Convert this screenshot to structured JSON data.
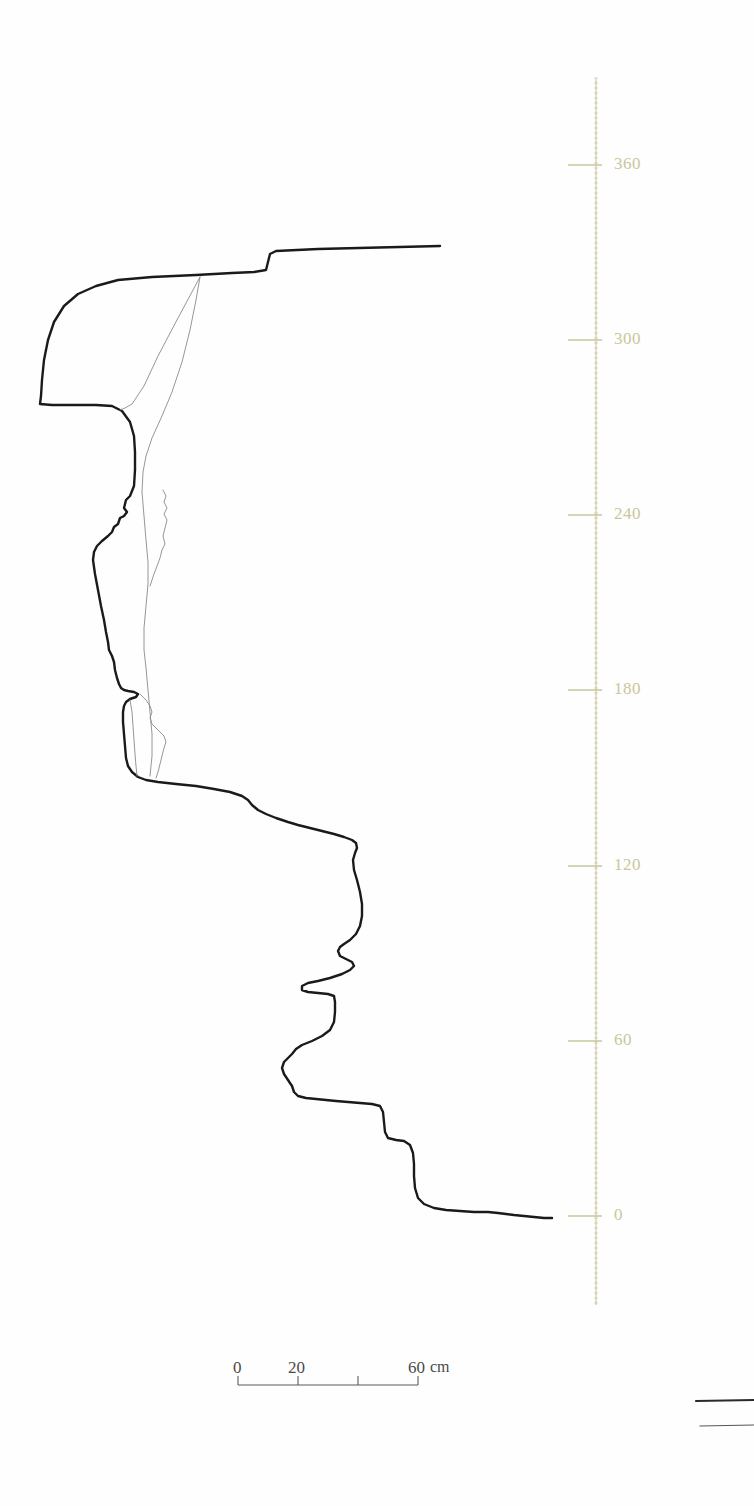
{
  "figure": {
    "kind": "archaeological-section-profile",
    "background_color": "#ffffff",
    "outline_color": "#1a1a1a",
    "interior_line_color": "#8a8a8a",
    "axis_color": "#c9c79a",
    "scalebar_color": "#5a5a5a"
  },
  "vertical_axis": {
    "name": "height-scale",
    "unit": "cm",
    "line_x": 596,
    "line_top": 78,
    "line_bottom": 1305,
    "tick_length": 28,
    "minor_tick_spacing": 5,
    "major_ticks": [
      {
        "label": "360",
        "value": 360,
        "y": 165
      },
      {
        "label": "300",
        "value": 300,
        "y": 340
      },
      {
        "label": "240",
        "value": 240,
        "y": 515
      },
      {
        "label": "180",
        "value": 180,
        "y": 690
      },
      {
        "label": "120",
        "value": 120,
        "y": 866
      },
      {
        "label": "60",
        "value": 60,
        "y": 1041
      },
      {
        "label": "0",
        "value": 0,
        "y": 1216
      }
    ]
  },
  "scale_bar": {
    "name": "horizontal-scale-bar",
    "x_start": 238,
    "x_end": 418,
    "y": 1385,
    "cap_height": 9,
    "ticks": [
      {
        "label": "0",
        "value": 0,
        "x": 238
      },
      {
        "label": "20",
        "value": 20,
        "x": 298
      },
      {
        "label": "",
        "value": 40,
        "x": 358
      },
      {
        "label": "60cm",
        "value": 60,
        "x": 418
      }
    ],
    "labels": [
      {
        "text": "0",
        "x": 233,
        "y": 1358
      },
      {
        "text": "20",
        "x": 288,
        "y": 1358
      },
      {
        "text": "60",
        "x": 408,
        "y": 1358
      },
      {
        "text": "cm",
        "x": 430,
        "y": 1358
      }
    ]
  },
  "profile": {
    "name": "main-section-outline",
    "stroke_width": 2.4,
    "path": "M 440 246 L 318 249 L 276 251 L 270 254 L 268 262 L 266 270 L 254 272 L 232 273 L 196 275 L 152 277 L 118 280 L 96 286 L 78 294 L 64 306 L 54 322 L 48 340 L 44 360 L 42 380 L 41 396 L 40 404 L 52 405 L 74 405 L 96 405 L 112 406 L 122 411 L 130 422 L 134 436 L 135 452 L 135 470 L 134 486 L 130 496 L 126 500 L 124 508 L 127 512 L 124 516 L 120 518 L 118 524 L 114 527 L 112 532 L 108 536 L 102 541 L 97 546 L 94 552 L 93 560 L 95 574 L 98 590 L 101 606 L 104 620 L 106 632 L 108 642 L 109 650 L 112 656 L 114 662 L 115 670 L 117 678 L 119 684 L 121 688 L 124 690 L 128 691 L 134 692 L 138 694 L 136 697 L 130 699 L 126 702 L 124 706 L 123 712 L 123 722 L 124 734 L 125 746 L 126 758 L 128 766 L 132 772 L 138 777 L 146 780 L 158 782 L 176 784 L 196 786 L 214 789 L 230 792 L 242 796 L 248 800 L 252 805 L 258 810 L 266 814 L 276 818 L 288 822 L 298 825 L 310 828 L 322 831 L 334 834 L 344 837 L 352 840 L 356 843 L 357 848 L 355 853 L 353 860 L 354 870 L 357 880 L 360 892 L 362 904 L 362 916 L 360 926 L 356 934 L 350 940 L 344 944 L 340 947 L 338 951 L 340 956 L 346 959 L 352 962 L 354 966 L 350 970 L 342 974 L 330 978 L 318 981 L 308 983 L 302 986 L 302 990 L 308 992 L 318 993 L 328 994 L 334 996 L 335 1002 L 335 1012 L 334 1022 L 330 1030 L 322 1036 L 312 1041 L 302 1045 L 296 1049 L 292 1054 L 288 1058 L 284 1062 L 282 1068 L 284 1074 L 288 1080 L 292 1086 L 294 1092 L 298 1096 L 306 1098 L 316 1099 L 326 1100 L 336 1101 L 348 1102 L 360 1103 L 372 1104 L 380 1106 L 383 1112 L 384 1122 L 385 1132 L 388 1138 L 396 1140 L 404 1141 L 410 1145 L 413 1153 L 414 1164 L 414 1176 L 415 1188 L 418 1198 L 424 1204 L 434 1208 L 446 1210 L 460 1211 L 474 1212 L 488 1212 L 498 1213 L 506 1214 L 514 1215 L 524 1216 L 534 1217 L 544 1218 L 552 1218"
  },
  "interior_lines": [
    {
      "name": "stratigraphic-line-upper",
      "stroke_width": 0.9,
      "path": "M 200 277 L 196 300 L 190 330 L 182 362 L 172 392 L 162 416 L 152 438 L 146 456 L 143 472 L 142 492 L 144 516 L 146 540 L 148 562 L 148 584 L 146 606 L 144 628 L 144 650 L 146 668 L 148 690 L 150 712 L 152 734 L 152 756 L 150 776"
    },
    {
      "name": "stratigraphic-line-diagonal",
      "stroke_width": 0.9,
      "path": "M 200 277 L 178 318 L 158 356 L 144 386 L 132 404 L 125 408 L 120 410"
    },
    {
      "name": "stratigraphic-inclusion-upper",
      "stroke_width": 0.9,
      "path": "M 163 490 L 166 496 L 164 502 L 167 508 L 164 514 L 167 520 L 165 528 L 163 536 L 165 544 L 162 550 L 160 558 L 157 566 L 154 574 L 152 580 L 150 586"
    },
    {
      "name": "stratigraphic-inclusion-lower",
      "stroke_width": 0.9,
      "path": "M 140 694 L 146 700 L 150 706 L 152 712 L 150 718 L 152 724 L 156 728 L 160 732 L 164 736 L 166 742 L 164 748 L 162 756 L 160 764 L 158 772 L 156 778"
    },
    {
      "name": "stratigraphic-inclusion-inner",
      "stroke_width": 0.9,
      "path": "M 130 700 L 132 712 L 133 726 L 134 740 L 135 754 L 136 766 L 137 776"
    }
  ],
  "corner_marks": [
    {
      "name": "edge-line-upper",
      "x1": 696,
      "y1": 1401,
      "x2": 754,
      "y2": 1400,
      "stroke_width": 2.2,
      "color": "#2a2a2a"
    },
    {
      "name": "edge-line-lower",
      "x1": 700,
      "y1": 1426,
      "x2": 754,
      "y2": 1425,
      "stroke_width": 1.2,
      "color": "#555555"
    }
  ]
}
